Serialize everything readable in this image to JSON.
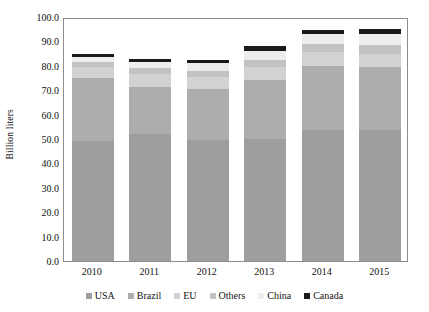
{
  "chart_data": {
    "type": "bar",
    "stacked": true,
    "title": "",
    "xlabel": "",
    "ylabel": "Billion liters",
    "categories": [
      "2010",
      "2011",
      "2012",
      "2013",
      "2014",
      "2015"
    ],
    "ylim": [
      0.0,
      100.0
    ],
    "ytick_step": 10.0,
    "ytick_labels": [
      "100.0",
      "90.0",
      "80.0",
      "70.0",
      "60.0",
      "50.0",
      "40.0",
      "30.0",
      "20.0",
      "10.0",
      "0.0"
    ],
    "ytick_values": [
      100.0,
      90.0,
      80.0,
      70.0,
      60.0,
      50.0,
      40.0,
      30.0,
      20.0,
      10.0,
      0.0
    ],
    "grid": false,
    "legend_position": "bottom",
    "series": [
      {
        "name": "USA",
        "color": "#9e9e9e",
        "values": [
          49.0,
          52.0,
          49.5,
          50.0,
          53.5,
          53.5
        ]
      },
      {
        "name": "Brazil",
        "color": "#adadad",
        "values": [
          26.0,
          19.5,
          21.0,
          24.0,
          26.5,
          26.0
        ]
      },
      {
        "name": "EU",
        "color": "#d2d2d2",
        "values": [
          4.5,
          5.0,
          5.0,
          5.5,
          5.5,
          5.5
        ]
      },
      {
        "name": "Others",
        "color": "#c2c2c2",
        "values": [
          2.0,
          2.5,
          2.5,
          3.0,
          3.5,
          3.5
        ]
      },
      {
        "name": "China",
        "color": "#ededed",
        "values": [
          2.0,
          2.5,
          3.0,
          3.5,
          4.0,
          4.5
        ]
      },
      {
        "name": "Canada",
        "color": "#1a1a1a",
        "values": [
          1.5,
          1.5,
          1.5,
          2.0,
          1.5,
          2.0
        ]
      }
    ],
    "totals": [
      85.0,
      83.0,
      82.5,
      88.0,
      94.5,
      95.0
    ]
  },
  "legend": {
    "items": [
      {
        "label": "USA"
      },
      {
        "label": "Brazil"
      },
      {
        "label": "EU"
      },
      {
        "label": "Others"
      },
      {
        "label": "China"
      },
      {
        "label": "Canada"
      }
    ]
  },
  "axes": {
    "y_title": "Billion liters"
  }
}
